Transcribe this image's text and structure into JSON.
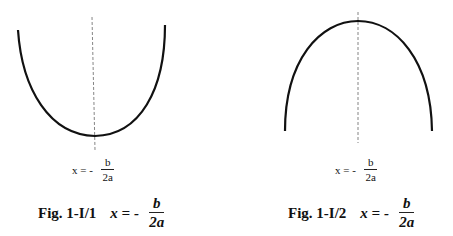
{
  "figures": [
    {
      "id": "fig1",
      "curve": "parabola-opening-up",
      "axis": "dashed vertical line of symmetry",
      "small_formula": {
        "lhs": "x = -",
        "numerator": "b",
        "denominator": "2a"
      },
      "caption": {
        "label": "Fig. 1-I/1",
        "lhs": "x = -",
        "numerator": "b",
        "denominator": "2a"
      }
    },
    {
      "id": "fig2",
      "curve": "parabola-opening-down",
      "axis": "dashed vertical line of symmetry",
      "small_formula": {
        "lhs": "x = -",
        "numerator": "b",
        "denominator": "2a"
      },
      "caption": {
        "label": "Fig. 1-I/2",
        "lhs": "x = -",
        "numerator": "b",
        "denominator": "2a"
      }
    }
  ],
  "colors": {
    "curve": "#111111",
    "axis": "#666666",
    "background": "#ffffff"
  }
}
